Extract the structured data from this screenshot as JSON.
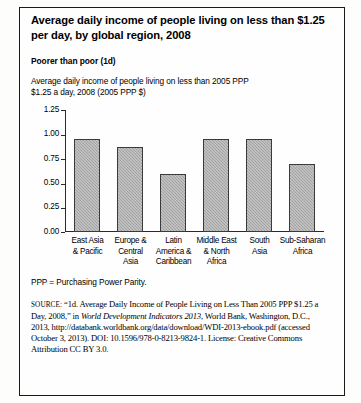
{
  "figure": {
    "title": "Average daily income of people living on less than $1.25 per day, by global region, 2008",
    "subhead": "Poorer than poor (1d)",
    "description_line1": "Average daily income of people living on less than 2005 PPP",
    "description_line2": "$1.25 a day, 2008 (2005 PPP $)",
    "ppp_note": "PPP = Purchasing Power Parity."
  },
  "chart_data": {
    "type": "bar",
    "title": "Average daily income of people living on less than 2005 PPP $1.25 a day, 2008 (2005 PPP $)",
    "xlabel": "",
    "ylabel": "",
    "categories": [
      "East Asia & Pacific",
      "Europe & Central Asia",
      "Latin America & Caribbean",
      "Middle East & North Africa",
      "South Asia",
      "Sub-Saharan Africa"
    ],
    "category_lines": [
      [
        "East Asia",
        "& Pacific"
      ],
      [
        "Europe &",
        "Central",
        "Asia"
      ],
      [
        "Latin",
        "America &",
        "Caribbean"
      ],
      [
        "Middle East",
        "& North",
        "Africa"
      ],
      [
        "South",
        "Asia"
      ],
      [
        "Sub-Saharan",
        "Africa"
      ]
    ],
    "values": [
      0.96,
      0.88,
      0.6,
      0.96,
      0.96,
      0.7
    ],
    "ylim": [
      0.0,
      1.25
    ],
    "yticks": [
      0.0,
      0.25,
      0.5,
      0.75,
      1.0,
      1.25
    ],
    "ytick_labels": [
      "0.00",
      "0.25",
      "0.50",
      "0.75",
      "1.00",
      "1.25"
    ],
    "grid": false,
    "legend": "none",
    "bar_color": "#a9a9a9",
    "bar_edge_color": "#3a3a3a",
    "axis_color": "#2a2a2a"
  },
  "source": {
    "keyword": "SOURCE:",
    "part1": " “1d. Average Daily Income of People Living on Less Than 2005 PPP $1.25 a Day, 2008,” in ",
    "italic1": "World Development Indicators 2013",
    "part2": ", World Bank, Washington, D.C., 2013, http://databank.worldbank.org/data/download/WDI-2013-ebook.pdf (accessed October 3, 2013). DOI: 10.1596/978-0-8213-9824-1. License: Creative Commons Attribution CC BY 3.0."
  }
}
